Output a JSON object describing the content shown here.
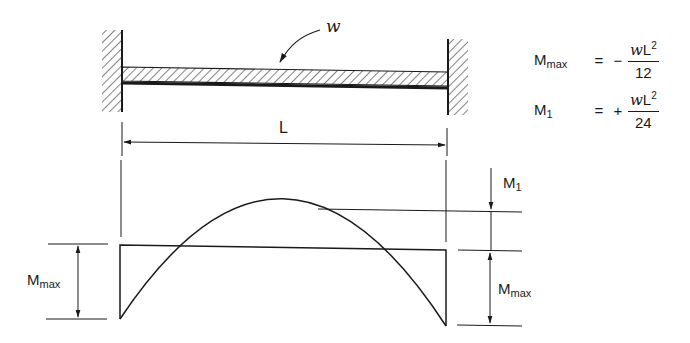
{
  "diagram": {
    "type": "fixed-fixed beam, uniform load, bending moment diagram",
    "load_label": "w",
    "span_label": "L",
    "left_dim_label": {
      "main": "M",
      "sub": "max"
    },
    "right_top_dim_label": {
      "main": "M",
      "sub": "1"
    },
    "right_bottom_dim_label": {
      "main": "M",
      "sub": "max"
    }
  },
  "formulas": [
    {
      "lhs_main": "M",
      "lhs_sub": "max",
      "eq": "=",
      "sign": "−",
      "num_w": "w",
      "num_L": "L",
      "num_exp": "2",
      "den": "12"
    },
    {
      "lhs_main": "M",
      "lhs_sub": "1",
      "eq": "=",
      "sign": "+",
      "num_w": "w",
      "num_L": "L",
      "num_exp": "2",
      "den": "24"
    }
  ],
  "colors": {
    "ink": "#1a1a1a",
    "background": "#ffffff"
  }
}
